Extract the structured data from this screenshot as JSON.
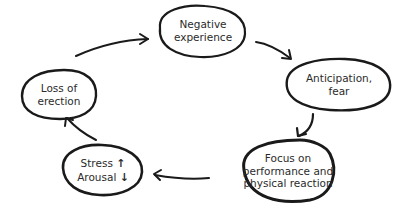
{
  "diagram": {
    "type": "cycle",
    "nodes": [
      {
        "id": "negative-experience",
        "lines": [
          "Negative",
          "experience"
        ]
      },
      {
        "id": "anticipation-fear",
        "lines": [
          "Anticipation,",
          "fear"
        ]
      },
      {
        "id": "focus-on-performance",
        "lines": [
          "Focus on",
          "performance and",
          "physical reaction"
        ]
      },
      {
        "id": "stress-arousal",
        "lines": [
          "Stress",
          "Arousal"
        ],
        "indicators": [
          "↑",
          "↓"
        ]
      },
      {
        "id": "loss-of-erection",
        "lines": [
          "Loss of",
          "erection"
        ]
      }
    ],
    "edges": [
      {
        "from": "negative-experience",
        "to": "anticipation-fear"
      },
      {
        "from": "anticipation-fear",
        "to": "focus-on-performance"
      },
      {
        "from": "focus-on-performance",
        "to": "stress-arousal"
      },
      {
        "from": "stress-arousal",
        "to": "loss-of-erection"
      },
      {
        "from": "loss-of-erection",
        "to": "negative-experience"
      }
    ],
    "colors": {
      "stroke": "#1a1a1a",
      "text": "#2b2b2b",
      "background": "#ffffff"
    }
  }
}
